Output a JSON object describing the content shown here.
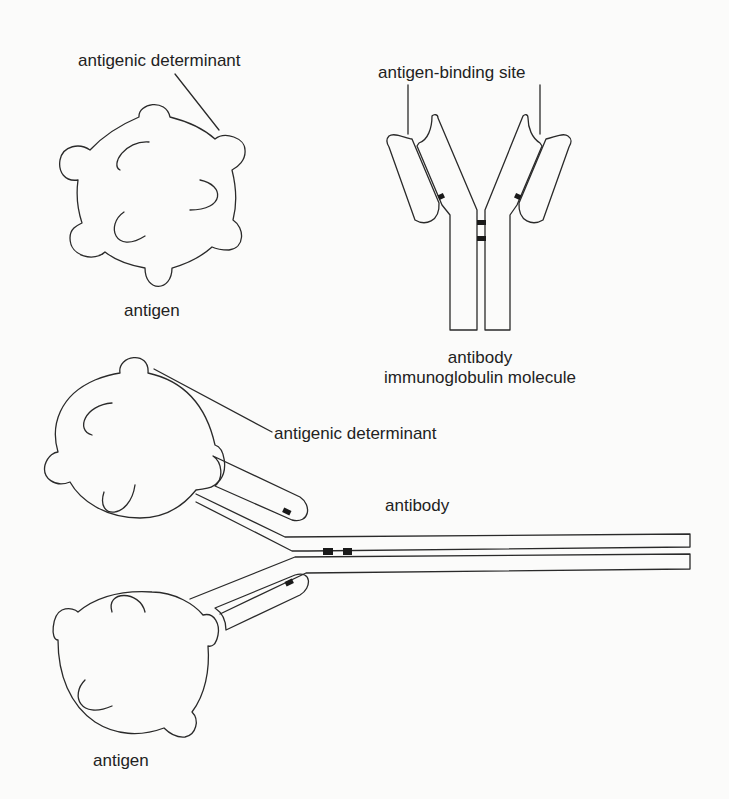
{
  "diagram": {
    "top_left": {
      "determinant_label": "antigenic determinant",
      "antigen_label": "antigen"
    },
    "top_right": {
      "binding_site_label": "antigen-binding site",
      "antibody_label": "antibody",
      "molecule_label": "immunoglobulin molecule"
    },
    "bottom": {
      "determinant_label": "antigenic determinant",
      "antibody_label": "antibody",
      "antigen_label": "antigen"
    },
    "colors": {
      "stroke": "#2a2a2a",
      "background": "#fbfbfa",
      "disulfide": "#1a1a1a"
    }
  }
}
